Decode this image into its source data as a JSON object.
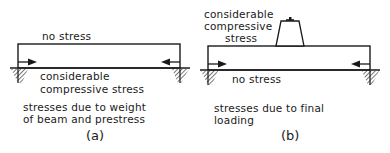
{
  "panels": [
    {
      "id": "a",
      "top_label": "no stress",
      "bottom_label_lines": [
        "considerable",
        "compressive stress"
      ],
      "caption_lines": [
        "stresses due to weight",
        "of beam and prestress"
      ],
      "panel_label": "(a)"
    },
    {
      "id": "b",
      "top_label_lines": [
        "considerable",
        "compressive",
        "stress"
      ],
      "bottom_label": "no stress",
      "caption_lines": [
        "stresses due to final",
        "loading"
      ],
      "panel_label": "(b)"
    }
  ],
  "colors": {
    "ink": "#1a1a1a",
    "background": "#ffffff"
  }
}
